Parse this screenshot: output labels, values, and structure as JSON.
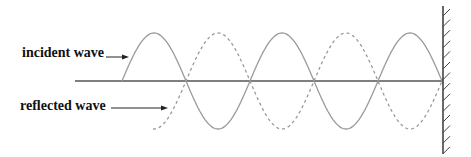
{
  "labels": {
    "incident": "incident wave",
    "reflected": "reflected wave"
  },
  "colors": {
    "wave": "#9a9a9a",
    "baseline": "#555555",
    "wall": "#444444",
    "arrow": "#222222",
    "text": "#111111"
  },
  "geometry": {
    "baseline_y": 81,
    "baseline_x_start": 75,
    "wall_x": 443,
    "wall_y_top": 6,
    "wall_y_bottom": 154,
    "amplitude": 48,
    "half_wavelength": 64,
    "incident_start_x": 122,
    "reflected_start_x": 153
  },
  "waves": [
    {
      "name": "incident wave",
      "style": "solid"
    },
    {
      "name": "reflected wave",
      "style": "dashed"
    }
  ]
}
